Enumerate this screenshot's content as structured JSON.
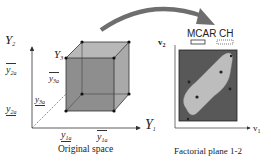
{
  "left_panel": {
    "caption": "Original space",
    "axis_y2": {
      "main": "Y",
      "sub": "2"
    },
    "axis_y1": {
      "main": "Y",
      "sub": "1"
    },
    "axis_y3": {
      "main": "Y",
      "sub": "3"
    },
    "tick_y2_upper": {
      "main": "y",
      "sub": "2a",
      "bar": "over"
    },
    "tick_y2_lower": {
      "main": "y",
      "sub": "2a",
      "bar": "under"
    },
    "tick_y3_upper": {
      "main": "y",
      "sub": "3a",
      "bar": "over"
    },
    "tick_y3_lower": {
      "main": "y",
      "sub": "3a",
      "bar": "under"
    },
    "tick_y1_lower": {
      "main": "y",
      "sub": "1a",
      "bar": "under"
    },
    "tick_y1_upper": {
      "main": "y",
      "sub": "1a",
      "bar": "over"
    }
  },
  "right_panel": {
    "caption": "Factorial plane 1-2",
    "axis_v2": {
      "main": "v",
      "sub": "2"
    },
    "axis_v1": {
      "main": "v",
      "sub": "1"
    },
    "legend": [
      {
        "label": "MCAR",
        "style": "solid-outline"
      },
      {
        "label": "CH",
        "style": "dotted-outline"
      }
    ]
  },
  "colors": {
    "cube_front": "#8a8a8a",
    "cube_side": "#a9a9a9",
    "cube_top": "#b8b8b8",
    "plane_bg": "#5a5a5a",
    "hull_fill": "#bdbdbd",
    "arrow": "#6e6e6e",
    "axis": "#333333"
  }
}
